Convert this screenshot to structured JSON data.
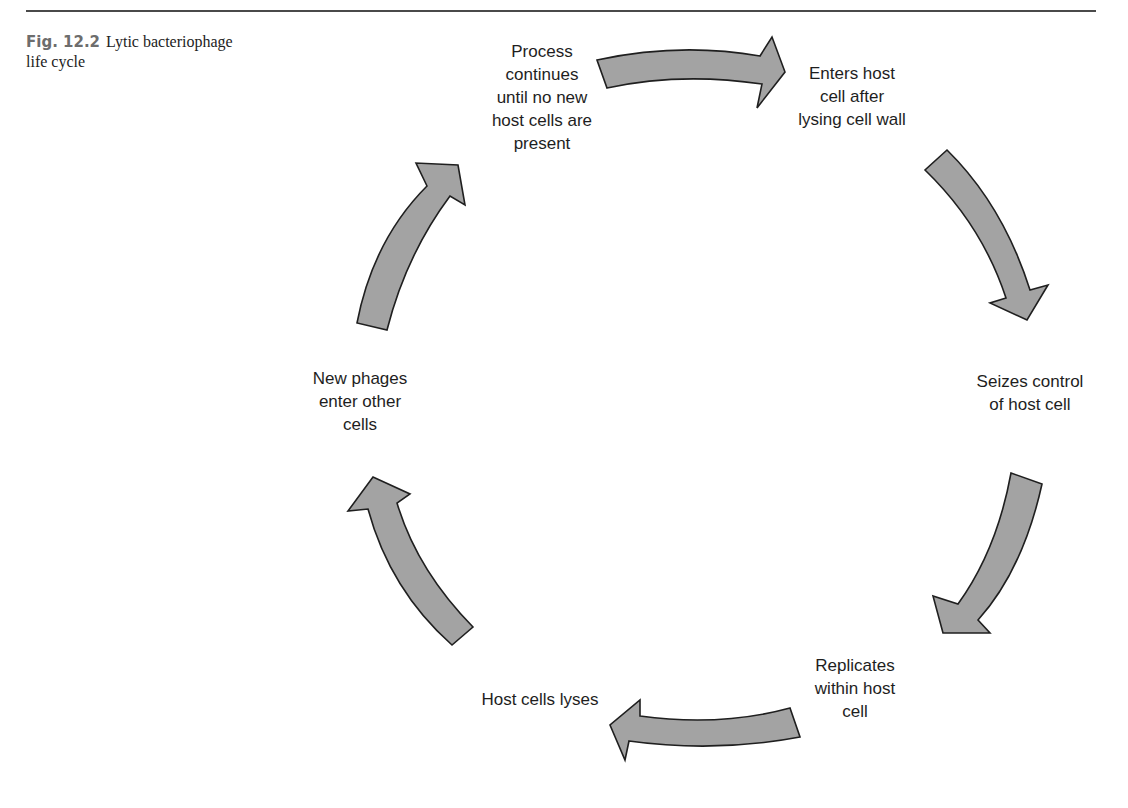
{
  "caption": {
    "figure_number": "Fig. 12.2",
    "title": "Lytic bacteriophage life cycle"
  },
  "colors": {
    "arrow_fill": "#a3a3a3",
    "arrow_stroke": "#1f1f1f",
    "rule": "#4a4a4a",
    "figure_number": "#6d6d6d",
    "text": "#1e1e1e"
  },
  "cycle": {
    "steps": [
      {
        "lines": [
          "Process",
          "continues",
          "until no new",
          "host cells are",
          "present"
        ]
      },
      {
        "lines": [
          "Enters host",
          "cell after",
          "lysing cell wall"
        ]
      },
      {
        "lines": [
          "Seizes control",
          "of host cell"
        ]
      },
      {
        "lines": [
          "Replicates",
          "within host",
          "cell"
        ]
      },
      {
        "lines": [
          "Host cells lyses"
        ]
      },
      {
        "lines": [
          "New phages",
          "enter other",
          "cells"
        ]
      }
    ],
    "arrows": [
      {
        "icon": "curved-arrow-right-icon",
        "from_step": 0,
        "to_step": 1
      },
      {
        "icon": "curved-arrow-down-icon",
        "from_step": 1,
        "to_step": 2
      },
      {
        "icon": "curved-arrow-down-left-icon",
        "from_step": 2,
        "to_step": 3
      },
      {
        "icon": "curved-arrow-left-icon",
        "from_step": 3,
        "to_step": 4
      },
      {
        "icon": "curved-arrow-up-left-icon",
        "from_step": 4,
        "to_step": 5
      },
      {
        "icon": "curved-arrow-up-right-icon",
        "from_step": 5,
        "to_step": 0
      }
    ]
  }
}
